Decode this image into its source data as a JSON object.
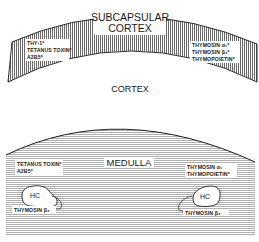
{
  "diagram": {
    "type": "thymus-zone-schematic",
    "regions": {
      "subcapsular_cortex": {
        "label_line1": "SUBCAPSULAR",
        "label_line2": "CORTEX",
        "shading": "vertical-hatch",
        "left_markers": [
          "THY-1*",
          "TETANUS TOXIN*",
          "A2B5*"
        ],
        "right_markers": [
          "THYMOSIN α₁*",
          "THYMOSIN β₃*",
          "THYMOPOIETIN*"
        ]
      },
      "cortex": {
        "label": "CORTEX",
        "shading": "none"
      },
      "medulla": {
        "label": "MEDULLA",
        "shading": "horizontal-hatch",
        "left_markers": [
          "TETANUS TOXIN*",
          "A2B5*"
        ],
        "right_markers": [
          "THYMOSIN α₁",
          "THYMOPOIETIN*"
        ],
        "hassall_corpuscles": [
          {
            "label": "HC",
            "marker": "THYMOSIN β₃",
            "position": "left"
          },
          {
            "label": "HC",
            "marker": "THYMOSIN β₃",
            "position": "right"
          }
        ]
      }
    },
    "colors": {
      "ink": "#1a1a1a",
      "background": "#ffffff"
    }
  }
}
